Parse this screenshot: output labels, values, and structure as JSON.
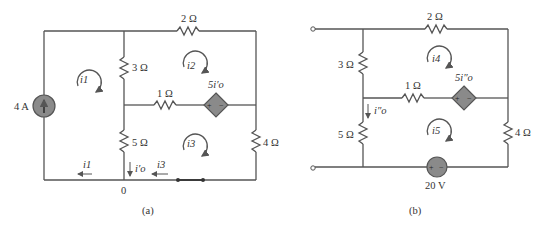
{
  "figure": {
    "panels": [
      {
        "caption": "(a)",
        "labels": {
          "r_top": "2 Ω",
          "r_3": "3 Ω",
          "r_1": "1 Ω",
          "r_5": "5 Ω",
          "r_4": "4 Ω",
          "dep_source": "5i′o",
          "current_source": "4 A",
          "mesh_1": "i1",
          "mesh_2": "i2",
          "mesh_3": "i3",
          "branch_i1": "i1",
          "branch_io": "i′o",
          "branch_i3": "i3",
          "node_ref": "0"
        }
      },
      {
        "caption": "(b)",
        "labels": {
          "r_top": "2 Ω",
          "r_3": "3 Ω",
          "r_1": "1 Ω",
          "r_5": "5 Ω",
          "r_4": "4 Ω",
          "dep_source": "5i″o",
          "voltage_source": "20 V",
          "mesh_4": "i4",
          "mesh_5": "i5",
          "branch_io": "i″o"
        }
      }
    ],
    "colors": {
      "wire": "#555555",
      "source_fill": "#8a8a8a",
      "text": "#333333"
    }
  }
}
